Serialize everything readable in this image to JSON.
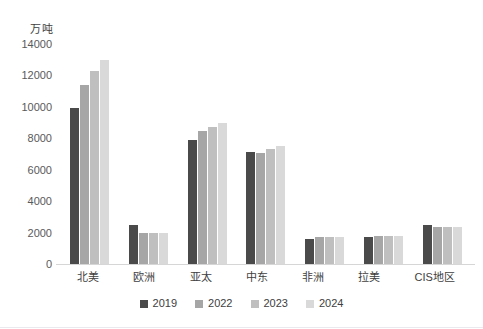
{
  "chart_data": {
    "type": "bar",
    "title": "",
    "subtitle": "",
    "xlabel": "",
    "ylabel": "万吨",
    "unit_label": "万吨",
    "ylim": [
      0,
      14000
    ],
    "ytick_step": 2000,
    "yticks": [
      "0",
      "2000",
      "4000",
      "6000",
      "8000",
      "10000",
      "12000",
      "14000"
    ],
    "ytick_values": [
      0,
      2000,
      4000,
      6000,
      8000,
      10000,
      12000,
      14000
    ],
    "grid": false,
    "legend_position": "bottom",
    "categories": [
      "北美",
      "欧洲",
      "亚太",
      "中东",
      "非洲",
      "拉美",
      "CIS地区"
    ],
    "series": [
      {
        "name": "2019",
        "color": "#4a4a4a",
        "values": [
          9950,
          2500,
          7900,
          7100,
          1600,
          1720,
          2500
        ]
      },
      {
        "name": "2022",
        "color": "#a6a6a6",
        "values": [
          11400,
          2000,
          8450,
          7050,
          1700,
          1780,
          2350
        ]
      },
      {
        "name": "2023",
        "color": "#bfbfbf",
        "values": [
          12300,
          1950,
          8750,
          7300,
          1720,
          1800,
          2350
        ]
      },
      {
        "name": "2024",
        "color": "#d9d9d9",
        "values": [
          13000,
          1950,
          9000,
          7500,
          1750,
          1800,
          2350
        ]
      }
    ]
  },
  "legend": {
    "items": [
      {
        "label": "2019",
        "color": "#4a4a4a"
      },
      {
        "label": "2022",
        "color": "#a6a6a6"
      },
      {
        "label": "2023",
        "color": "#bfbfbf"
      },
      {
        "label": "2024",
        "color": "#d9d9d9"
      }
    ]
  }
}
